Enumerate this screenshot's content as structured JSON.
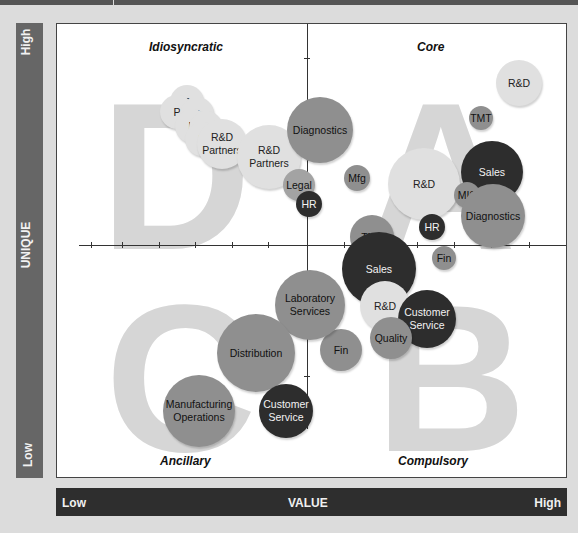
{
  "y_axis": {
    "title": "UNIQUE",
    "high": "High",
    "low": "Low"
  },
  "x_axis": {
    "title": "VALUE",
    "low": "Low",
    "high": "High"
  },
  "quadrants": {
    "top_left": "Idiosyncratic",
    "top_right": "Core",
    "bottom_left": "Ancillary",
    "bottom_right": "Compulsory"
  },
  "letters": {
    "top_left": "D",
    "top_right": "A",
    "bottom_left": "C",
    "bottom_right": "B"
  },
  "colors": {
    "light": "#e0e0e0",
    "mid": "#8f8f8f",
    "dark": "#2d2d2d",
    "band": "#2e2e2e",
    "y_band": "#666666"
  },
  "chart_data": {
    "type": "scatter",
    "title": "",
    "xlabel": "VALUE",
    "ylabel": "UNIQUE",
    "x_ticks": [
      "Low",
      "High"
    ],
    "y_ticks": [
      "Low",
      "High"
    ],
    "grid": false,
    "bubbles": [
      {
        "label": "P",
        "quadrant": "Idiosyncratic",
        "x": 130,
        "y": 78,
        "r": 17,
        "shade": "light"
      },
      {
        "label": "P",
        "quadrant": "Idiosyncratic",
        "x": 120,
        "y": 88,
        "r": 17,
        "shade": "light"
      },
      {
        "label": "P",
        "quadrant": "Idiosyncratic",
        "x": 140,
        "y": 90,
        "r": 17,
        "shade": "light"
      },
      {
        "label": "P",
        "quadrant": "Idiosyncratic",
        "x": 135,
        "y": 102,
        "r": 17,
        "shade": "light"
      },
      {
        "label": "P",
        "quadrant": "Idiosyncratic",
        "x": 149,
        "y": 104,
        "r": 17,
        "shade": "light"
      },
      {
        "label": "P",
        "quadrant": "Idiosyncratic",
        "x": 145,
        "y": 115,
        "r": 17,
        "shade": "light"
      },
      {
        "label": "R&D Partners",
        "quadrant": "Idiosyncratic",
        "x": 165,
        "y": 120,
        "r": 25,
        "shade": "light"
      },
      {
        "label": "R&D Partners",
        "quadrant": "Idiosyncratic",
        "x": 212,
        "y": 133,
        "r": 32,
        "shade": "light"
      },
      {
        "label": "Diagnostics",
        "quadrant": "Idiosyncratic",
        "x": 263,
        "y": 106,
        "r": 33,
        "shade": "mid"
      },
      {
        "label": "Legal",
        "quadrant": "Idiosyncratic",
        "x": 242,
        "y": 161,
        "r": 16,
        "shade": "midl"
      },
      {
        "label": "HR",
        "quadrant": "Idiosyncratic",
        "x": 252,
        "y": 180,
        "r": 13,
        "shade": "dark"
      },
      {
        "label": "R&D",
        "quadrant": "Core",
        "x": 462,
        "y": 59,
        "r": 23,
        "shade": "light"
      },
      {
        "label": "TMT",
        "quadrant": "Core",
        "x": 424,
        "y": 94,
        "r": 12,
        "shade": "mid"
      },
      {
        "label": "Mfg",
        "quadrant": "Core",
        "x": 300,
        "y": 154,
        "r": 13,
        "shade": "mid"
      },
      {
        "label": "R&D",
        "quadrant": "Core",
        "x": 367,
        "y": 160,
        "r": 36,
        "shade": "light"
      },
      {
        "label": "Sales",
        "quadrant": "Core",
        "x": 435,
        "y": 148,
        "r": 31,
        "shade": "dark"
      },
      {
        "label": "MIS",
        "quadrant": "Core",
        "x": 410,
        "y": 171,
        "r": 13,
        "shade": "mid"
      },
      {
        "label": "Diagnostics",
        "quadrant": "Core",
        "x": 436,
        "y": 192,
        "r": 32,
        "shade": "mid"
      },
      {
        "label": "HR",
        "quadrant": "Core",
        "x": 375,
        "y": 203,
        "r": 13,
        "shade": "dark"
      },
      {
        "label": "TMT",
        "quadrant": "Core",
        "x": 315,
        "y": 213,
        "r": 22,
        "shade": "mid"
      },
      {
        "label": "Fin",
        "quadrant": "Compulsory",
        "x": 387,
        "y": 234,
        "r": 12,
        "shade": "mid"
      },
      {
        "label": "Sales",
        "quadrant": "Compulsory",
        "x": 322,
        "y": 245,
        "r": 37,
        "shade": "dark"
      },
      {
        "label": "R&D",
        "quadrant": "Compulsory",
        "x": 328,
        "y": 282,
        "r": 25,
        "shade": "light"
      },
      {
        "label": "Customer Service",
        "quadrant": "Compulsory",
        "x": 370,
        "y": 295,
        "r": 29,
        "shade": "dark"
      },
      {
        "label": "Quality",
        "quadrant": "Compulsory",
        "x": 334,
        "y": 314,
        "r": 21,
        "shade": "mid"
      },
      {
        "label": "Fin",
        "quadrant": "Ancillary",
        "x": 284,
        "y": 326,
        "r": 21,
        "shade": "mid"
      },
      {
        "label": "Laboratory Services",
        "quadrant": "Ancillary",
        "x": 253,
        "y": 281,
        "r": 35,
        "shade": "mid"
      },
      {
        "label": "Distribution",
        "quadrant": "Ancillary",
        "x": 199,
        "y": 329,
        "r": 39,
        "shade": "mid"
      },
      {
        "label": "Customer Service",
        "quadrant": "Ancillary",
        "x": 229,
        "y": 387,
        "r": 27,
        "shade": "dark"
      },
      {
        "label": "Manufacturing Operations",
        "quadrant": "Ancillary",
        "x": 142,
        "y": 387,
        "r": 36,
        "shade": "mid"
      }
    ]
  }
}
